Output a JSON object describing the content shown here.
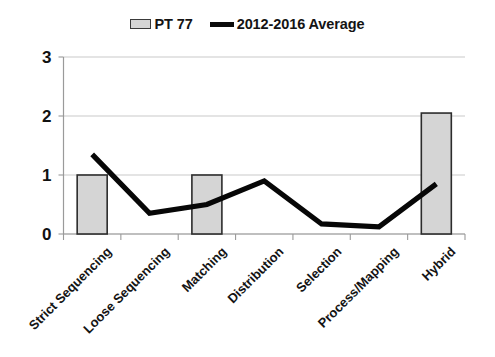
{
  "chart_data": {
    "type": "bar",
    "title": "",
    "subtitle": "",
    "xlabel": "",
    "ylabel": "",
    "categories": [
      "Strict Sequencing",
      "Loose Sequencing",
      "Matching",
      "Distribution",
      "Selection",
      "Process/Mapping",
      "Hybrid"
    ],
    "series": [
      {
        "name": "PT 77",
        "type": "bar",
        "color": "#d5d5d5",
        "border_color": "#2c2c2c",
        "values": [
          1,
          0,
          1,
          0,
          0,
          0,
          2.05
        ]
      },
      {
        "name": "2012-2016 Average",
        "type": "line",
        "color": "#070707",
        "values": [
          1.35,
          0.35,
          0.5,
          0.9,
          0.17,
          0.12,
          0.85
        ]
      }
    ],
    "ylim": [
      0,
      3
    ],
    "yticks": [
      0,
      1,
      2,
      3
    ],
    "ytick_labels": [
      "0",
      "1",
      "2",
      "3"
    ],
    "grid": true,
    "grid_axis": "y",
    "legend_position": "top-center",
    "xtick_label_rotation": -45
  },
  "legend": {
    "entries": [
      {
        "label": "PT 77",
        "marker": "bar-swatch"
      },
      {
        "label": "2012-2016 Average",
        "marker": "line-swatch"
      }
    ]
  },
  "axis": {
    "y_tick_0": "0",
    "y_tick_1": "1",
    "y_tick_2": "2",
    "y_tick_3": "3"
  }
}
